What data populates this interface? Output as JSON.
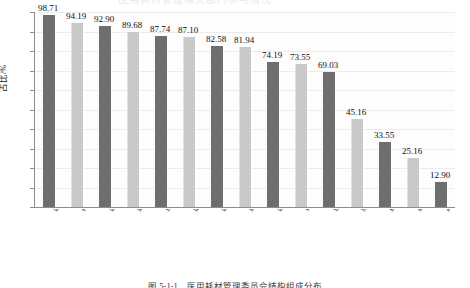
{
  "chart_data": {
    "type": "bar",
    "title": "",
    "xlabel": "",
    "ylabel": "占比/%",
    "ylim": [
      0,
      100
    ],
    "ytick_step": 10,
    "yticks": [
      0,
      10,
      20,
      30,
      40,
      50,
      60,
      70,
      80,
      90,
      100
    ],
    "grid": true,
    "legend": "none",
    "categories": [
      "医用耗材管理",
      "相关临床科室",
      "医务管理",
      "财务管理",
      "护理",
      "医保管理",
      "医院感染管理",
      "纪检监察",
      "医技科室",
      "审计",
      "信息管理",
      "经营管理",
      "药学",
      "病案管理",
      "其他"
    ],
    "values": [
      98.71,
      94.19,
      92.9,
      89.68,
      87.74,
      87.1,
      82.58,
      81.94,
      74.19,
      73.55,
      69.03,
      45.16,
      33.55,
      25.16,
      12.9
    ],
    "value_labels": [
      "98.71",
      "94.19",
      "92.90",
      "89.68",
      "87.74",
      "87.10",
      "82.58",
      "81.94",
      "74.19",
      "73.55",
      "69.03",
      "45.16",
      "33.55",
      "25.16",
      "12.90"
    ],
    "bar_colors_alternating": [
      "#6e6e6e",
      "#c9c9c9"
    ],
    "axis_color": "#8d8d8d",
    "gridline_color": "#ececed",
    "background": "#ffffff"
  },
  "caption": {
    "text": "图 5-1-1　医用耗材管理委员会结构组成分布"
  },
  "header": {
    "ghost_text": "医用耗材管理相关部门参与情况"
  }
}
